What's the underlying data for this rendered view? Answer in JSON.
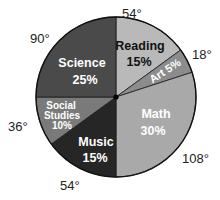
{
  "chart_data": {
    "type": "pie",
    "title": "",
    "start_angle_deg_clockwise_from_top": 0,
    "slices": [
      {
        "name": "Reading",
        "percent": 15,
        "degrees": 54,
        "label": "Reading",
        "percent_label": "15%",
        "degree_label": "54°",
        "color": "#b9b9b9",
        "text_color": "#111111"
      },
      {
        "name": "Art",
        "percent": 5,
        "degrees": 18,
        "label": "Art 5%",
        "percent_label": "5%",
        "degree_label": "18°",
        "color": "#8c8c8c",
        "text_color": "#ffffff"
      },
      {
        "name": "Math",
        "percent": 30,
        "degrees": 108,
        "label": "Math",
        "percent_label": "30%",
        "degree_label": "108°",
        "color": "#a9a9a9",
        "text_color": "#ffffff"
      },
      {
        "name": "Music",
        "percent": 15,
        "degrees": 54,
        "label": "Music",
        "percent_label": "15%",
        "degree_label": "54°",
        "color": "#262626",
        "text_color": "#ffffff"
      },
      {
        "name": "Social Studies",
        "percent": 10,
        "degrees": 36,
        "label": "Social Studies",
        "percent_label": "10%",
        "degree_label": "36°",
        "color": "#7a7a7a",
        "text_color": "#ffffff"
      },
      {
        "name": "Science",
        "percent": 25,
        "degrees": 90,
        "label": "Science",
        "percent_label": "25%",
        "degree_label": "90°",
        "color": "#4a4a4a",
        "text_color": "#ffffff"
      }
    ],
    "categories": [
      "Reading",
      "Art",
      "Math",
      "Music",
      "Social Studies",
      "Science"
    ],
    "values": [
      15,
      5,
      30,
      15,
      10,
      25
    ],
    "legend": "none (labels inside slices, degree labels outside)"
  },
  "labels": {
    "reading_name": "Reading",
    "reading_pct": "15%",
    "reading_deg": "54°",
    "art_text": "Art 5%",
    "art_deg": "18°",
    "math_name": "Math",
    "math_pct": "30%",
    "math_deg": "108°",
    "music_name": "Music",
    "music_pct": "15%",
    "music_deg": "54°",
    "social_line1": "Social",
    "social_line2": "Studies",
    "social_pct": "10%",
    "social_deg": "36°",
    "science_name": "Science",
    "science_pct": "25%",
    "science_deg": "90°"
  }
}
